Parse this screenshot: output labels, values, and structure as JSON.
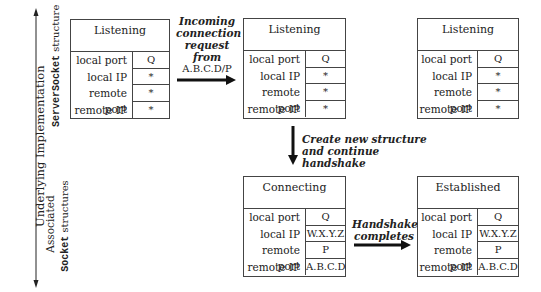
{
  "side_labels": {
    "main_axis": "Underlying Implementation",
    "serversocket_mono": "ServerSocket",
    "serversocket_rest": " structure",
    "associated": "Associated",
    "socket_mono": "Socket",
    "socket_rest": " structures"
  },
  "boxes": [
    {
      "state": "Listening",
      "rows": [
        {
          "label": "local port",
          "value": "Q"
        },
        {
          "label": "local IP",
          "value": "*"
        },
        {
          "label": "remote port",
          "value": "*"
        },
        {
          "label": "remote IP",
          "value": "*"
        }
      ]
    },
    {
      "state": "Listening",
      "rows": [
        {
          "label": "local port",
          "value": "Q"
        },
        {
          "label": "local IP",
          "value": "*"
        },
        {
          "label": "remote port",
          "value": "*"
        },
        {
          "label": "remote IP",
          "value": "*"
        }
      ]
    },
    {
      "state": "Listening",
      "rows": [
        {
          "label": "local port",
          "value": "Q"
        },
        {
          "label": "local IP",
          "value": "*"
        },
        {
          "label": "remote port",
          "value": "*"
        },
        {
          "label": "remote IP",
          "value": "*"
        }
      ]
    },
    {
      "state": "Connecting",
      "rows": [
        {
          "label": "local port",
          "value": "Q"
        },
        {
          "label": "local IP",
          "value": "W.X.Y.Z"
        },
        {
          "label": "remote port",
          "value": "P"
        },
        {
          "label": "remote IP",
          "value": "A.B.C.D"
        }
      ]
    },
    {
      "state": "Established",
      "rows": [
        {
          "label": "local port",
          "value": "Q"
        },
        {
          "label": "local IP",
          "value": "W.X.Y.Z"
        },
        {
          "label": "remote port",
          "value": "P"
        },
        {
          "label": "remote IP",
          "value": "A.B.C.D"
        }
      ]
    }
  ],
  "annotations": {
    "incoming_l1": "Incoming",
    "incoming_l2": "connection",
    "incoming_l3": "request",
    "incoming_l4": "from",
    "incoming_addr": "A.B.C.D/P",
    "create_l1": "Create new structure",
    "create_l2": "and continue handshake",
    "handshake_l1": "Handshake",
    "handshake_l2": "completes"
  }
}
